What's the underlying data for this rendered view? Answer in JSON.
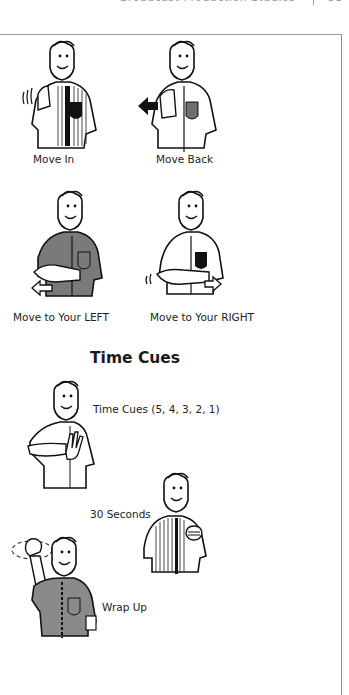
{
  "page": {
    "running_header": {
      "text": "Broadcast Production Studios",
      "page_number": "53"
    }
  },
  "cues_section_1": {
    "items": [
      {
        "label": "Move In",
        "shirt": "striped",
        "pocket_color": "#111111",
        "gesture": "wave-in"
      },
      {
        "label": "Move Back",
        "shirt": "white",
        "pocket_color": "#6e6e6e",
        "gesture": "arrow-left"
      },
      {
        "label": "Move  to  Your  LEFT",
        "shirt": "gray",
        "shirt_color": "#7a7a7a",
        "gesture": "arrow-left-hollow"
      },
      {
        "label": "Move to Your RIGHT",
        "shirt": "white",
        "pocket_color": "#111111",
        "gesture": "arrow-right-hollow"
      }
    ]
  },
  "time_cues": {
    "heading": "Time Cues",
    "items": [
      {
        "label": "Time Cues (5, 4, 3, 2, 1)",
        "gesture": "fingers-count"
      },
      {
        "label": "30 Seconds",
        "shirt": "striped",
        "gesture": "fist-chest"
      },
      {
        "label": "Wrap Up",
        "shirt": "gray",
        "shirt_color": "#8a8a8a",
        "gesture": "fist-circle"
      }
    ]
  }
}
